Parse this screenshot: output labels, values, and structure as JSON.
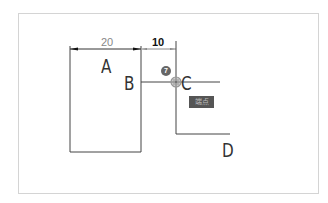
{
  "diagram": {
    "labels": {
      "a": "A",
      "b": "B",
      "c": "C",
      "d": "D"
    },
    "dimensions": {
      "width_a": "20",
      "gap": "10"
    },
    "snap_badge": "7",
    "snap_tag": "端点",
    "colors": {
      "line": "#333333",
      "dim_text_20": "#888888",
      "dim_text_10": "#111111",
      "frame": "#d4d4d4",
      "tag_bg": "#555555"
    }
  }
}
